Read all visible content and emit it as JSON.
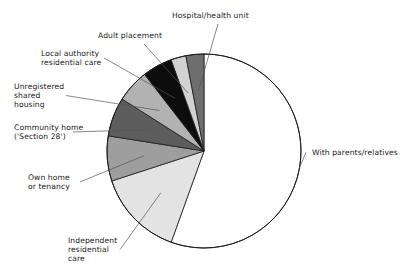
{
  "chart_data": {
    "type": "pie",
    "title": "",
    "xlabel": "",
    "ylabel": "",
    "legend_position": "none",
    "grid": false,
    "start_angle_deg": 0,
    "direction": "clockwise",
    "center": {
      "x": 204,
      "y": 151
    },
    "radius": 97,
    "categories": [
      "With parents/relatives",
      "Independent residential care",
      "Own home or tenancy",
      "Community home ('Section 28')",
      "Unregistered shared housing",
      "Local authority residential care",
      "Adult placement",
      "Hospital/health unit"
    ],
    "values": [
      55.5,
      14.5,
      7.5,
      6.5,
      5.5,
      5.0,
      2.5,
      3.0
    ],
    "unit": "percent",
    "slices": [
      {
        "label": "With parents/relatives",
        "value": 55.5,
        "color": "#ffffff",
        "label_lines": [
          "With parents/relatives"
        ],
        "label_x": 312,
        "label_y": 155,
        "label_anchor": "start"
      },
      {
        "label": "Independent residential care",
        "value": 14.5,
        "color": "#e3e3e3",
        "label_lines": [
          "Independent",
          "residential",
          "care"
        ],
        "label_x": 68,
        "label_y": 243,
        "label_anchor": "start"
      },
      {
        "label": "Own home or tenancy",
        "value": 7.5,
        "color": "#9e9e9e",
        "label_lines": [
          "Own home",
          "or tenancy"
        ],
        "label_x": 28,
        "label_y": 180,
        "label_anchor": "start"
      },
      {
        "label": "Community home ('Section 28')",
        "value": 6.5,
        "color": "#5d5d5d",
        "label_lines": [
          "Community home",
          "('Section 28')"
        ],
        "label_x": 14,
        "label_y": 130,
        "label_anchor": "start"
      },
      {
        "label": "Unregistered shared housing",
        "value": 5.5,
        "color": "#b2b2b2",
        "label_lines": [
          "Unregistered",
          "shared",
          "housing"
        ],
        "label_x": 14,
        "label_y": 89,
        "label_anchor": "start"
      },
      {
        "label": "Local authority residential care",
        "value": 5.0,
        "color": "#0d0d0d",
        "label_lines": [
          "Local authority",
          "residential care"
        ],
        "label_x": 41,
        "label_y": 56,
        "label_anchor": "start"
      },
      {
        "label": "Adult placement",
        "value": 2.5,
        "color": "#d2d2d2",
        "label_lines": [
          "Adult placement"
        ],
        "label_x": 98,
        "label_y": 38,
        "label_anchor": "start"
      },
      {
        "label": "Hospital/health unit",
        "value": 3.0,
        "color": "#6e6e6e",
        "label_lines": [
          "Hospital/health unit"
        ],
        "label_x": 172,
        "label_y": 18,
        "label_anchor": "start"
      }
    ],
    "colors": {
      "outline": "#1c1c1c",
      "leader_line": "#555555",
      "label_text": "#1a1a1a",
      "background": "#ffffff"
    }
  }
}
